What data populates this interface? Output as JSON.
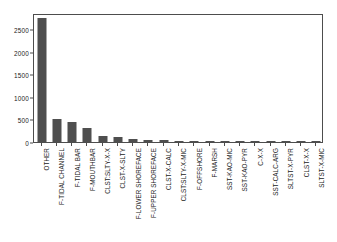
{
  "chart_data": {
    "type": "bar",
    "title": "",
    "subtitle": "",
    "xlabel": "",
    "ylabel": "",
    "ylim": [
      0,
      2860
    ],
    "grid": false,
    "legend": null,
    "yticks": [
      0,
      500,
      1000,
      1500,
      2000,
      2500
    ],
    "ytick_labels": [
      "0",
      "500",
      "1000",
      "1500",
      "2000",
      "2500"
    ],
    "categories": [
      "OTHER",
      "F-TIDAL CHANNEL",
      "F-TIDAL BAR",
      "F-MOUTHBAR",
      "CLST:SLTY-X-X",
      "CLST-X-SLTY",
      "F-LOWER SHOREFACE",
      "F-UPPER SHOREFACE",
      "CLST-X-CALC",
      "CLST:SLTY-X-MIC",
      "F-OFFSHORE",
      "F-MARSH",
      "SST-KAO-MIC",
      "SST-KAO-PYR",
      "C-X-X",
      "SST-CALC-ARG",
      "SLTST-X-PYR",
      "CLST-X-X",
      "SLTST-X-MIC"
    ],
    "values": [
      2750,
      510,
      450,
      320,
      130,
      110,
      65,
      50,
      35,
      30,
      8,
      6,
      5,
      4,
      3,
      3,
      2,
      2,
      1
    ],
    "bar_color": "#4f4f4f",
    "axis_color": "#4d4d4d",
    "background_color": "#ffffff"
  }
}
